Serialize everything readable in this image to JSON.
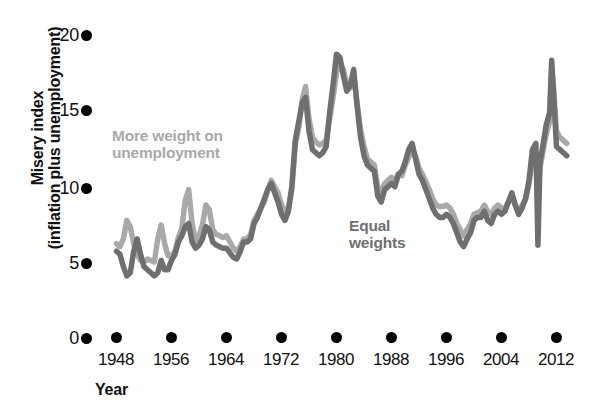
{
  "chart_data": {
    "type": "line",
    "title": "",
    "xlabel": "Year",
    "ylabel_line1": "Misery index",
    "ylabel_line2": "(inflation plus unemployment)",
    "xlim": [
      1948,
      2014
    ],
    "ylim": [
      0,
      20
    ],
    "yticks": [
      0,
      5,
      10,
      15,
      20
    ],
    "ytick_labels": [
      "0",
      "5",
      "10",
      "15",
      "20"
    ],
    "xticks": [
      1948,
      1956,
      1964,
      1972,
      1980,
      1988,
      1996,
      2004,
      2012
    ],
    "xtick_labels": [
      "1948",
      "1956",
      "1964",
      "1972",
      "1980",
      "1988",
      "1996",
      "2004",
      "2012"
    ],
    "grid": false,
    "legend_position": "inline-annotations",
    "annotations": [
      {
        "name": "more-weight-on-unemployment",
        "text_line1": "More weight on",
        "text_line2": "unemployment",
        "color": "#a9a9a9",
        "x_px": 112,
        "y_px": 127
      },
      {
        "name": "equal-weights",
        "text_line1": "Equal",
        "text_line2": "weights",
        "color": "#6f6f6f",
        "x_px": 349,
        "y_px": 217
      }
    ],
    "series": [
      {
        "name": "More weight on unemployment",
        "color": "#a9a9a9",
        "linewidth": 5.5,
        "x": [
          1948.0,
          1948.5,
          1949.0,
          1949.5,
          1950.0,
          1950.5,
          1951.0,
          1951.5,
          1952.0,
          1952.5,
          1953.0,
          1953.5,
          1954.0,
          1954.5,
          1955.0,
          1955.5,
          1956.0,
          1956.5,
          1957.0,
          1957.5,
          1958.0,
          1958.5,
          1959.0,
          1959.5,
          1960.0,
          1960.5,
          1961.0,
          1961.5,
          1962.0,
          1962.5,
          1963.0,
          1963.5,
          1964.0,
          1964.5,
          1965.0,
          1965.5,
          1966.0,
          1966.5,
          1967.0,
          1967.5,
          1968.0,
          1968.5,
          1969.0,
          1969.5,
          1970.0,
          1970.5,
          1971.0,
          1971.5,
          1972.0,
          1972.5,
          1973.0,
          1973.5,
          1974.0,
          1974.5,
          1975.0,
          1975.5,
          1976.0,
          1976.5,
          1977.0,
          1977.5,
          1978.0,
          1978.5,
          1979.0,
          1979.5,
          1980.0,
          1980.5,
          1981.0,
          1981.5,
          1982.0,
          1982.5,
          1983.0,
          1983.5,
          1984.0,
          1984.5,
          1985.0,
          1985.5,
          1986.0,
          1986.5,
          1987.0,
          1987.5,
          1988.0,
          1988.5,
          1989.0,
          1989.5,
          1990.0,
          1990.5,
          1991.0,
          1991.5,
          1992.0,
          1992.5,
          1993.0,
          1993.5,
          1994.0,
          1994.5,
          1995.0,
          1995.5,
          1996.0,
          1996.5,
          1997.0,
          1997.5,
          1998.0,
          1998.5,
          1999.0,
          1999.5,
          2000.0,
          2000.5,
          2001.0,
          2001.5,
          2002.0,
          2002.5,
          2003.0,
          2003.5,
          2004.0,
          2004.5,
          2005.0,
          2005.5,
          2006.0,
          2006.5,
          2007.0,
          2007.5,
          2008.0,
          2008.5,
          2009.0,
          2009.3,
          2009.6,
          2010.0,
          2010.5,
          2011.0,
          2011.3,
          2011.6,
          2012.0,
          2012.5,
          2013.0,
          2013.5
        ],
        "y": [
          6.1,
          5.9,
          6.4,
          7.6,
          7.2,
          6.1,
          5.4,
          5.0,
          4.9,
          5.1,
          5.0,
          4.9,
          6.4,
          7.3,
          6.1,
          5.3,
          5.3,
          5.6,
          6.5,
          7.1,
          8.9,
          9.6,
          7.4,
          6.3,
          6.6,
          7.3,
          8.6,
          8.3,
          7.0,
          6.7,
          6.6,
          6.5,
          6.6,
          6.2,
          5.8,
          5.6,
          5.9,
          6.4,
          6.4,
          6.7,
          7.6,
          8.0,
          8.4,
          8.8,
          9.6,
          10.2,
          9.8,
          9.4,
          8.6,
          8.2,
          8.4,
          9.6,
          12.5,
          13.6,
          15.4,
          16.3,
          14.2,
          13.0,
          12.7,
          12.5,
          12.6,
          12.8,
          14.2,
          15.6,
          17.2,
          17.8,
          17.4,
          16.4,
          16.2,
          17.0,
          15.2,
          13.5,
          12.4,
          11.6,
          11.4,
          11.2,
          9.8,
          9.5,
          10.0,
          10.2,
          10.4,
          10.2,
          10.6,
          10.5,
          11.2,
          11.7,
          12.2,
          11.8,
          11.0,
          10.6,
          10.1,
          9.6,
          9.0,
          8.6,
          8.5,
          8.5,
          8.6,
          8.4,
          8.0,
          7.4,
          7.0,
          6.6,
          7.0,
          7.4,
          8.0,
          8.1,
          8.2,
          8.6,
          8.2,
          8.0,
          8.4,
          8.6,
          8.4,
          8.4,
          8.8,
          9.2,
          8.6,
          8.2,
          8.6,
          9.0,
          10.0,
          11.5,
          12.0,
          9.6,
          11.0,
          12.0,
          13.2,
          14.0,
          17.5,
          16.0,
          13.4,
          13.0,
          12.8,
          12.6
        ]
      },
      {
        "name": "Equal weights",
        "color": "#6f6f6f",
        "linewidth": 5.5,
        "x": [
          1948.0,
          1948.5,
          1949.0,
          1949.5,
          1950.0,
          1950.5,
          1951.0,
          1951.5,
          1952.0,
          1952.5,
          1953.0,
          1953.5,
          1954.0,
          1954.5,
          1955.0,
          1955.5,
          1956.0,
          1956.5,
          1957.0,
          1957.5,
          1958.0,
          1958.5,
          1959.0,
          1959.5,
          1960.0,
          1960.5,
          1961.0,
          1961.5,
          1962.0,
          1962.5,
          1963.0,
          1963.5,
          1964.0,
          1964.5,
          1965.0,
          1965.5,
          1966.0,
          1966.5,
          1967.0,
          1967.5,
          1968.0,
          1968.5,
          1969.0,
          1969.5,
          1970.0,
          1970.5,
          1971.0,
          1971.5,
          1972.0,
          1972.5,
          1973.0,
          1973.5,
          1974.0,
          1974.5,
          1975.0,
          1975.5,
          1976.0,
          1976.5,
          1977.0,
          1977.5,
          1978.0,
          1978.5,
          1979.0,
          1979.5,
          1980.0,
          1980.5,
          1981.0,
          1981.5,
          1982.0,
          1982.5,
          1983.0,
          1983.5,
          1984.0,
          1984.5,
          1985.0,
          1985.5,
          1986.0,
          1986.5,
          1987.0,
          1987.5,
          1988.0,
          1988.5,
          1989.0,
          1989.5,
          1990.0,
          1990.5,
          1991.0,
          1991.5,
          1992.0,
          1992.5,
          1993.0,
          1993.5,
          1994.0,
          1994.5,
          1995.0,
          1995.5,
          1996.0,
          1996.5,
          1997.0,
          1997.5,
          1998.0,
          1998.5,
          1999.0,
          1999.5,
          2000.0,
          2000.5,
          2001.0,
          2001.5,
          2002.0,
          2002.5,
          2003.0,
          2003.5,
          2004.0,
          2004.5,
          2005.0,
          2005.5,
          2006.0,
          2006.5,
          2007.0,
          2007.5,
          2008.0,
          2008.5,
          2009.0,
          2009.3,
          2009.6,
          2010.0,
          2010.5,
          2011.0,
          2011.3,
          2011.6,
          2012.0,
          2012.5,
          2013.0,
          2013.5
        ],
        "y": [
          5.6,
          5.4,
          4.6,
          4.0,
          4.2,
          5.6,
          6.4,
          5.4,
          4.6,
          4.4,
          4.2,
          4.0,
          4.2,
          5.0,
          4.4,
          4.4,
          5.0,
          5.4,
          6.2,
          6.6,
          7.2,
          7.4,
          6.2,
          5.8,
          6.0,
          6.4,
          7.2,
          7.0,
          6.2,
          6.0,
          5.9,
          5.8,
          5.8,
          5.5,
          5.2,
          5.1,
          5.6,
          6.2,
          6.2,
          6.4,
          7.4,
          7.8,
          8.4,
          9.0,
          9.6,
          10.0,
          9.4,
          8.8,
          8.0,
          7.6,
          8.2,
          9.8,
          12.8,
          14.0,
          15.2,
          15.6,
          13.4,
          12.2,
          12.0,
          11.8,
          12.0,
          12.4,
          14.6,
          16.4,
          18.4,
          18.2,
          17.0,
          16.0,
          16.4,
          17.4,
          15.0,
          13.0,
          11.8,
          11.2,
          11.0,
          10.8,
          9.2,
          8.8,
          9.6,
          9.8,
          10.0,
          9.8,
          10.6,
          10.8,
          11.4,
          12.2,
          12.6,
          11.6,
          10.6,
          10.2,
          9.6,
          9.0,
          8.4,
          8.0,
          7.8,
          7.8,
          8.0,
          7.8,
          7.4,
          6.8,
          6.2,
          5.9,
          6.4,
          6.8,
          7.6,
          7.8,
          7.8,
          8.2,
          7.6,
          7.4,
          8.0,
          8.2,
          8.0,
          8.2,
          8.8,
          9.4,
          8.6,
          8.0,
          8.4,
          9.0,
          10.2,
          12.2,
          12.6,
          6.0,
          11.4,
          12.4,
          13.8,
          14.6,
          18.0,
          15.6,
          12.4,
          12.2,
          12.0,
          11.8
        ]
      }
    ]
  },
  "axis": {
    "x_title": "Year",
    "y_title_line1": "Misery index",
    "y_title_line2": "(inflation plus unemployment)"
  },
  "colors": {
    "light_series": "#a9a9a9",
    "dark_series": "#6f6f6f",
    "axis_marker": "#000000",
    "text": "#111111",
    "background": "#ffffff"
  }
}
